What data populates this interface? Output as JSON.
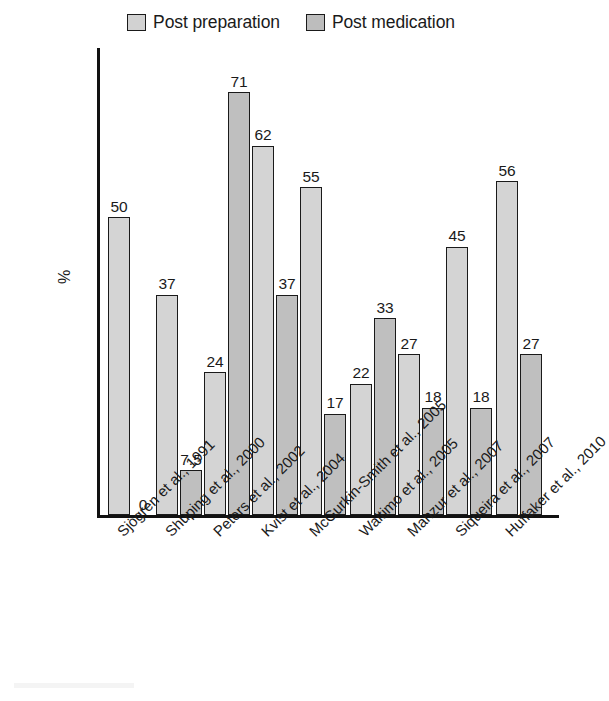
{
  "legend": {
    "position": "top-center",
    "entries": [
      {
        "label": "Post preparation",
        "color": "#d4d4d4",
        "swatch": "legend-swatch-post-preparation"
      },
      {
        "label": "Post medication",
        "color": "#bfbfbf",
        "swatch": "legend-swatch-post-medication"
      }
    ]
  },
  "axes": {
    "ylabel": "%",
    "xlabel": "",
    "ylim": [
      0,
      75
    ],
    "grid": false
  },
  "chart_data": {
    "type": "bar",
    "title": "",
    "subtitle": "",
    "xlabel": "",
    "ylabel": "%",
    "ylim": [
      0,
      75
    ],
    "grid": false,
    "legend_position": "top-center",
    "categories": [
      "Sjögren et al., 1991",
      "Shuping et al., 2000",
      "Peters et al., 2002",
      "Kvist et al., 2004",
      "McGurkin-Smith et al., 2005",
      "Waltimo et al., 2005",
      "Manzur et al., 2007",
      "Siqueira et al., 2007",
      "Huffaker et al., 2010"
    ],
    "series": [
      {
        "name": "Post preparation",
        "color": "#d4d4d4",
        "values": [
          50,
          37,
          24,
          62,
          55,
          22,
          27,
          45,
          56
        ],
        "value_labels": [
          "50",
          "37",
          "24",
          "62",
          "55",
          "22",
          "27",
          "45",
          "56"
        ]
      },
      {
        "name": "Post medication",
        "color": "#bfbfbf",
        "values": [
          0,
          7.5,
          71,
          37,
          17,
          33,
          18,
          18,
          27
        ],
        "value_labels": [
          "0",
          "7.5",
          "71",
          "37",
          "17",
          "33",
          "18",
          "18",
          "27"
        ]
      }
    ]
  }
}
